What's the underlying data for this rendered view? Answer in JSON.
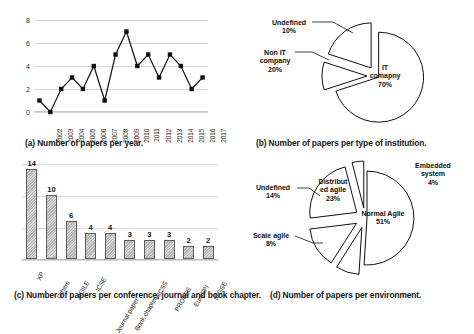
{
  "figure": {
    "captions": {
      "a": "(a) Number of papers per year.",
      "b": "(b) Number of papers per type of institution.",
      "c": "(c) Number of papers per conference, journal and book chapter.",
      "d": "(d) Number of papers per environment."
    }
  },
  "chart_data": [
    {
      "id": "a",
      "type": "line",
      "title": "(a) Number of papers per year.",
      "xlabel": "",
      "ylabel": "",
      "ylim": [
        0,
        8
      ],
      "yticks": [
        0,
        2,
        4,
        6,
        8
      ],
      "grid": true,
      "legend": "none",
      "marker": "square",
      "categories": [
        "2002",
        "2003",
        "2004",
        "2005",
        "2006",
        "2007",
        "2008",
        "2009",
        "2010",
        "2011",
        "2012",
        "2013",
        "2014",
        "2015",
        "2016",
        "2017"
      ],
      "values": [
        1,
        0,
        2,
        3,
        2,
        4,
        1,
        5,
        7,
        4,
        5,
        3,
        5,
        4,
        2,
        3
      ]
    },
    {
      "id": "b",
      "type": "pie",
      "title": "(b) Number of papers per type of institution.",
      "exploded": true,
      "labels": [
        "IT comapny",
        "Undefined",
        "Non IT company"
      ],
      "values": [
        70,
        10,
        20
      ],
      "value_labels": [
        "70%",
        "10%",
        "20%"
      ],
      "slices": [
        {
          "label": "IT comapny",
          "label_lines": [
            "IT",
            "comapny",
            "70%"
          ],
          "percent": 70,
          "value_text": "70%"
        },
        {
          "label": "Undefined",
          "label_lines": [
            "Undefined",
            "10%"
          ],
          "percent": 10,
          "value_text": "10%"
        },
        {
          "label": "Non IT company",
          "label_lines": [
            "Non IT",
            "company",
            "20%"
          ],
          "percent": 20,
          "value_text": "20%"
        }
      ]
    },
    {
      "id": "c",
      "type": "bar",
      "title": "(c) Number of papers per conference, journal and book chapter.",
      "xlabel": "",
      "ylabel": "",
      "ylim": [
        0,
        15
      ],
      "grid": true,
      "categories": [
        "XP",
        "Others",
        "AGILE",
        "ICSE",
        "Journal paper",
        "Book chapter",
        "HICSS",
        "PROFES",
        "EuroSPI",
        "ICGSE"
      ],
      "values": [
        14,
        10,
        6,
        4,
        4,
        3,
        3,
        3,
        2,
        2
      ],
      "value_labels": [
        "14",
        "10",
        "6",
        "4",
        "4",
        "3",
        "3",
        "3",
        "2",
        "2"
      ]
    },
    {
      "id": "d",
      "type": "pie",
      "title": "(d) Number of papers per environment.",
      "exploded": true,
      "labels": [
        "Normal Agile",
        "Embedded system",
        "Distributed agile",
        "Undefined",
        "Scale agile"
      ],
      "values": [
        51,
        4,
        23,
        14,
        8
      ],
      "value_labels": [
        "51%",
        "4%",
        "23%",
        "14%",
        "8%"
      ],
      "slices": [
        {
          "label": "Normal Agile",
          "label_lines": [
            "Normal Agile",
            "51%"
          ],
          "percent": 51,
          "value_text": "51%"
        },
        {
          "label": "Embedded system",
          "label_lines": [
            "Embedded",
            "system",
            "4%"
          ],
          "percent": 4,
          "value_text": "4%"
        },
        {
          "label": "Distributed agile",
          "label_lines": [
            "Distribut",
            "ed agile",
            "23%"
          ],
          "percent": 23,
          "value_text": "23%"
        },
        {
          "label": "Undefined",
          "label_lines": [
            "Undefined",
            "14%"
          ],
          "percent": 14,
          "value_text": "14%"
        },
        {
          "label": "Scale agile",
          "label_lines": [
            "Scale agile",
            "8%"
          ],
          "percent": 8,
          "value_text": "8%"
        }
      ]
    }
  ]
}
